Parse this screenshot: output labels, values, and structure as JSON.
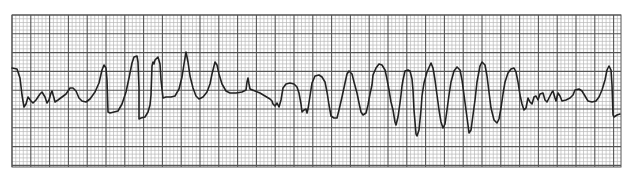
{
  "chart_data": {
    "type": "line",
    "title": "",
    "subtitle": "",
    "xlabel": "",
    "ylabel": "",
    "grid": {
      "on": true,
      "left": 12,
      "top": 15,
      "right": 621,
      "bottom": 167,
      "minor_px": 3.76,
      "major_every": 5,
      "minor_color": "#b8b8b8",
      "major_color": "#555555",
      "background": "#ffffff"
    },
    "trace_color": "#222222",
    "legend": [],
    "annotations": [],
    "series": [
      {
        "name": "ECG trace",
        "points": [
          [
            12,
            68
          ],
          [
            17,
            69
          ],
          [
            20,
            78
          ],
          [
            22,
            95
          ],
          [
            24,
            107
          ],
          [
            26,
            104
          ],
          [
            28,
            97
          ],
          [
            31,
            101
          ],
          [
            33,
            103
          ],
          [
            36,
            100
          ],
          [
            40,
            94
          ],
          [
            42,
            92
          ],
          [
            45,
            97
          ],
          [
            47,
            103
          ],
          [
            49,
            100
          ],
          [
            51,
            93
          ],
          [
            52,
            91
          ],
          [
            54,
            98
          ],
          [
            55,
            102
          ],
          [
            58,
            100
          ],
          [
            62,
            97
          ],
          [
            66,
            94
          ],
          [
            70,
            88
          ],
          [
            73,
            88
          ],
          [
            76,
            91
          ],
          [
            79,
            98
          ],
          [
            82,
            101
          ],
          [
            86,
            102
          ],
          [
            90,
            99
          ],
          [
            95,
            92
          ],
          [
            99,
            83
          ],
          [
            102,
            70
          ],
          [
            104,
            65
          ],
          [
            106,
            68
          ],
          [
            107,
            80
          ],
          [
            108,
            112
          ],
          [
            110,
            113
          ],
          [
            114,
            112
          ],
          [
            118,
            111
          ],
          [
            122,
            104
          ],
          [
            126,
            92
          ],
          [
            129,
            78
          ],
          [
            132,
            63
          ],
          [
            134,
            57
          ],
          [
            137,
            56
          ],
          [
            138,
            62
          ],
          [
            139,
            88
          ],
          [
            139,
            119
          ],
          [
            141,
            118
          ],
          [
            145,
            117
          ],
          [
            148,
            112
          ],
          [
            150,
            105
          ],
          [
            151,
            95
          ],
          [
            152,
            66
          ],
          [
            153,
            62
          ],
          [
            154,
            64
          ],
          [
            155,
            60
          ],
          [
            158,
            57
          ],
          [
            160,
            64
          ],
          [
            161,
            80
          ],
          [
            163,
            98
          ],
          [
            166,
            97
          ],
          [
            171,
            97
          ],
          [
            175,
            96
          ],
          [
            179,
            89
          ],
          [
            182,
            77
          ],
          [
            184,
            64
          ],
          [
            186,
            52
          ],
          [
            188,
            62
          ],
          [
            190,
            76
          ],
          [
            193,
            88
          ],
          [
            196,
            96
          ],
          [
            199,
            99
          ],
          [
            203,
            97
          ],
          [
            207,
            92
          ],
          [
            210,
            84
          ],
          [
            212,
            74
          ],
          [
            214,
            66
          ],
          [
            215,
            62
          ],
          [
            217,
            65
          ],
          [
            219,
            74
          ],
          [
            222,
            84
          ],
          [
            226,
            91
          ],
          [
            230,
            93
          ],
          [
            236,
            93
          ],
          [
            242,
            92
          ],
          [
            246,
            90
          ],
          [
            247,
            82
          ],
          [
            248,
            78
          ],
          [
            249,
            84
          ],
          [
            250,
            89
          ],
          [
            255,
            91
          ],
          [
            260,
            93
          ],
          [
            265,
            96
          ],
          [
            270,
            99
          ],
          [
            272,
            101
          ],
          [
            273,
            104
          ],
          [
            275,
            106
          ],
          [
            277,
            103
          ],
          [
            279,
            107
          ],
          [
            281,
            100
          ],
          [
            283,
            88
          ],
          [
            286,
            84
          ],
          [
            290,
            83
          ],
          [
            294,
            84
          ],
          [
            297,
            87
          ],
          [
            299,
            93
          ],
          [
            301,
            104
          ],
          [
            302,
            112
          ],
          [
            304,
            110
          ],
          [
            306,
            109
          ],
          [
            307,
            113
          ],
          [
            308,
            109
          ],
          [
            310,
            96
          ],
          [
            312,
            83
          ],
          [
            315,
            76
          ],
          [
            319,
            75
          ],
          [
            322,
            77
          ],
          [
            325,
            82
          ],
          [
            327,
            92
          ],
          [
            329,
            105
          ],
          [
            331,
            116
          ],
          [
            334,
            118
          ],
          [
            337,
            118
          ],
          [
            339,
            110
          ],
          [
            342,
            97
          ],
          [
            345,
            83
          ],
          [
            347,
            74
          ],
          [
            349,
            71
          ],
          [
            352,
            74
          ],
          [
            354,
            82
          ],
          [
            357,
            93
          ],
          [
            359,
            103
          ],
          [
            361,
            112
          ],
          [
            363,
            115
          ],
          [
            366,
            113
          ],
          [
            368,
            105
          ],
          [
            370,
            94
          ],
          [
            372,
            85
          ],
          [
            373,
            75
          ],
          [
            376,
            68
          ],
          [
            379,
            64
          ],
          [
            382,
            65
          ],
          [
            385,
            70
          ],
          [
            387,
            79
          ],
          [
            389,
            90
          ],
          [
            391,
            102
          ],
          [
            393,
            110
          ],
          [
            395,
            122
          ],
          [
            396,
            125
          ],
          [
            398,
            117
          ],
          [
            400,
            103
          ],
          [
            401,
            95
          ],
          [
            402,
            86
          ],
          [
            403,
            80
          ],
          [
            405,
            71
          ],
          [
            408,
            70
          ],
          [
            410,
            71
          ],
          [
            412,
            79
          ],
          [
            413,
            90
          ],
          [
            414,
            110
          ],
          [
            416,
            134
          ],
          [
            417,
            136
          ],
          [
            419,
            130
          ],
          [
            421,
            110
          ],
          [
            422,
            96
          ],
          [
            424,
            83
          ],
          [
            427,
            72
          ],
          [
            431,
            63
          ],
          [
            433,
            68
          ],
          [
            435,
            80
          ],
          [
            437,
            95
          ],
          [
            439,
            110
          ],
          [
            441,
            122
          ],
          [
            443,
            128
          ],
          [
            445,
            124
          ],
          [
            447,
            110
          ],
          [
            449,
            95
          ],
          [
            451,
            82
          ],
          [
            454,
            71
          ],
          [
            457,
            67
          ],
          [
            460,
            70
          ],
          [
            462,
            80
          ],
          [
            464,
            95
          ],
          [
            466,
            110
          ],
          [
            468,
            125
          ],
          [
            469,
            133
          ],
          [
            471,
            130
          ],
          [
            473,
            115
          ],
          [
            475,
            100
          ],
          [
            477,
            82
          ],
          [
            480,
            66
          ],
          [
            482,
            62
          ],
          [
            485,
            65
          ],
          [
            487,
            76
          ],
          [
            489,
            92
          ],
          [
            491,
            108
          ],
          [
            494,
            120
          ],
          [
            497,
            123
          ],
          [
            499,
            119
          ],
          [
            501,
            108
          ],
          [
            503,
            94
          ],
          [
            505,
            82
          ],
          [
            508,
            73
          ],
          [
            511,
            69
          ],
          [
            514,
            68
          ],
          [
            516,
            72
          ],
          [
            518,
            82
          ],
          [
            520,
            95
          ],
          [
            522,
            104
          ],
          [
            524,
            110
          ],
          [
            526,
            108
          ],
          [
            528,
            98
          ],
          [
            530,
            102
          ],
          [
            532,
            104
          ],
          [
            534,
            97
          ],
          [
            536,
            96
          ],
          [
            538,
            100
          ],
          [
            540,
            94
          ],
          [
            543,
            93
          ],
          [
            545,
            100
          ],
          [
            547,
            102
          ],
          [
            549,
            98
          ],
          [
            552,
            92
          ],
          [
            553,
            91
          ],
          [
            555,
            98
          ],
          [
            556,
            101
          ],
          [
            558,
            93
          ],
          [
            560,
            96
          ],
          [
            562,
            101
          ],
          [
            566,
            100
          ],
          [
            570,
            98
          ],
          [
            573,
            95
          ],
          [
            575,
            90
          ],
          [
            579,
            89
          ],
          [
            582,
            91
          ],
          [
            585,
            96
          ],
          [
            588,
            101
          ],
          [
            592,
            102
          ],
          [
            596,
            101
          ],
          [
            599,
            97
          ],
          [
            602,
            90
          ],
          [
            605,
            80
          ],
          [
            607,
            70
          ],
          [
            609,
            66
          ],
          [
            611,
            70
          ],
          [
            612,
            85
          ],
          [
            613,
            115
          ],
          [
            614,
            117
          ],
          [
            617,
            115
          ],
          [
            620,
            114
          ]
        ]
      }
    ]
  }
}
